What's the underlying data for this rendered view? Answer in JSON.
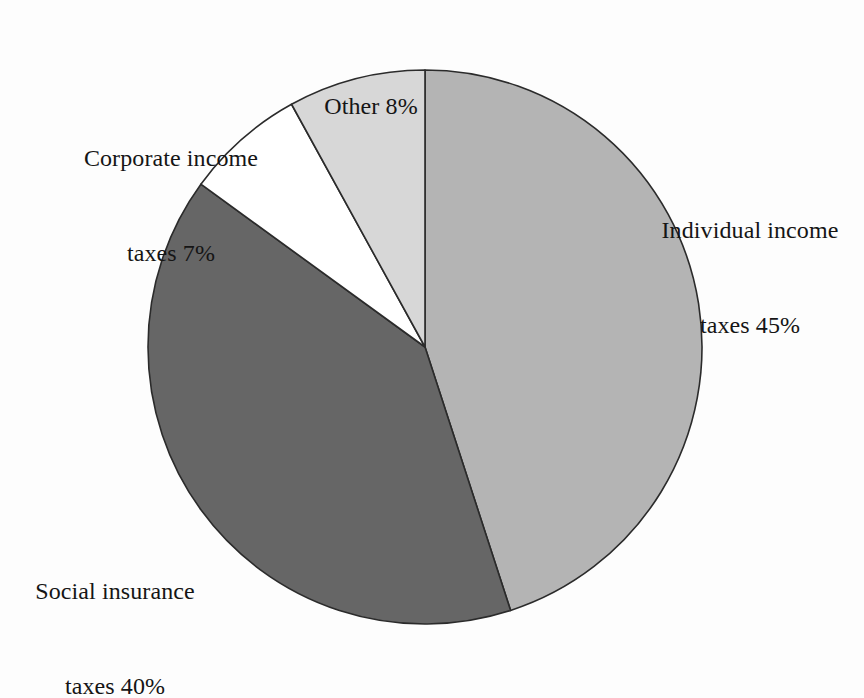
{
  "chart_data": {
    "type": "pie",
    "title": "",
    "subtitle": "",
    "xlabel": "",
    "ylabel": "",
    "legend_position": "none",
    "grid": false,
    "unit": "%",
    "total": 100,
    "start_angle_deg": 0,
    "direction": "clockwise",
    "categories": [
      "Individual income taxes",
      "Social insurance taxes",
      "Corporate income taxes",
      "Other"
    ],
    "values": [
      45,
      40,
      7,
      8
    ],
    "slices": [
      {
        "name": "individual-income-taxes",
        "label_line1": "Individual income",
        "label_line2": "taxes 45%",
        "label_text": "Individual income taxes 45%",
        "value": 45,
        "value_text": "45%",
        "color": "#b4b4b4",
        "stroke": "#2b2b2b",
        "start_deg": 0,
        "end_deg": 162
      },
      {
        "name": "social-insurance-taxes",
        "label_line1": "Social insurance",
        "label_line2": "taxes 40%",
        "label_text": "Social insurance taxes 40%",
        "value": 40,
        "value_text": "40%",
        "color": "#666666",
        "stroke": "#2b2b2b",
        "start_deg": 162,
        "end_deg": 306
      },
      {
        "name": "corporate-income-taxes",
        "label_line1": "Corporate income",
        "label_line2": "taxes 7%",
        "label_text": "Corporate income taxes 7%",
        "value": 7,
        "value_text": "7%",
        "color": "#ffffff",
        "stroke": "#2b2b2b",
        "start_deg": 306,
        "end_deg": 331.2
      },
      {
        "name": "other",
        "label_line1": "Other 8%",
        "label_line2": "",
        "label_text": "Other 8%",
        "value": 8,
        "value_text": "8%",
        "color": "#d7d7d7",
        "stroke": "#2b2b2b",
        "start_deg": 331.2,
        "end_deg": 360
      }
    ],
    "geometry": {
      "center_x": 425,
      "center_y": 347,
      "radius": 277
    },
    "background_color": "#fdfdfd"
  },
  "labels": {
    "other": {
      "line1": "Other 8%",
      "line2": ""
    },
    "corporate": {
      "line1": "Corporate income",
      "line2": "taxes 7%"
    },
    "individual": {
      "line1": "Individual income",
      "line2": "taxes 45%"
    },
    "social": {
      "line1": "Social insurance",
      "line2": "taxes 40%"
    }
  }
}
